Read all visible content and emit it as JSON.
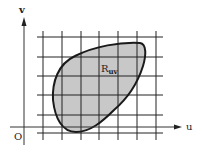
{
  "diagram": {
    "type": "region-on-grid",
    "axes": {
      "horizontal_label": "u",
      "vertical_label": "v",
      "origin_label": "O"
    },
    "region": {
      "label_main": "R",
      "label_subscript": "uv",
      "fill_color": "#c8c8c8",
      "stroke_color": "#1a1a1a"
    },
    "grid": {
      "vertical_lines_x": [
        43,
        62,
        81,
        99,
        118,
        137,
        156
      ],
      "horizontal_lines_y": [
        37,
        57,
        76,
        95,
        115,
        133
      ],
      "line_color": "#222222"
    },
    "colors": {
      "background": "#ffffff",
      "axis": "#333333"
    }
  }
}
